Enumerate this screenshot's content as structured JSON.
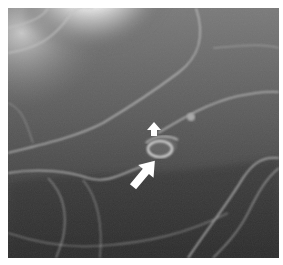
{
  "figure": {
    "kind": "grayscale radiograph (double-contrast barium study)",
    "colors": {
      "background_border": "#ffffff",
      "dark_tone": "#2e2e2e",
      "mid_tone": "#5a5a5a",
      "bright_tone": "#ffffff",
      "mucosal_line": "#bdbdbd",
      "arrow_fill": "#ffffff"
    },
    "annotations": [
      {
        "type": "arrow",
        "size": "small",
        "direction": "up",
        "label": ""
      },
      {
        "type": "arrow",
        "size": "large",
        "direction": "up-right",
        "label": ""
      }
    ],
    "finding": "ring-like lesion between the two arrows"
  }
}
